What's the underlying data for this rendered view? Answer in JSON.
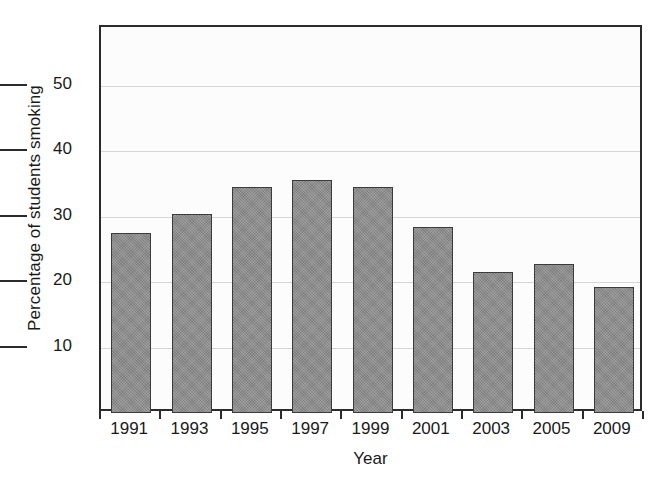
{
  "chart_data": {
    "type": "bar",
    "title": "",
    "xlabel": "Year",
    "ylabel": "Percentage of students smoking",
    "categories": [
      "1991",
      "1993",
      "1995",
      "1997",
      "1999",
      "2001",
      "2003",
      "2005",
      "2009"
    ],
    "values": [
      27.5,
      30.4,
      34.6,
      35.6,
      34.5,
      28.5,
      21.6,
      22.7,
      19.3
    ],
    "ylim": [
      0,
      59
    ],
    "xlim": [
      0,
      9
    ],
    "yticks": [
      10,
      20,
      30,
      40,
      50
    ],
    "ytick_labels": [
      "10",
      "20",
      "30",
      "40",
      "50"
    ],
    "grid": "horizontal",
    "legend": "none",
    "bar_color": "#8b8b8b",
    "bar_edge_color": "#3b3b3b",
    "axis_color": "#2b2b2b",
    "grid_color": "#d6d6d6",
    "background_color": "#fcfcfc"
  }
}
